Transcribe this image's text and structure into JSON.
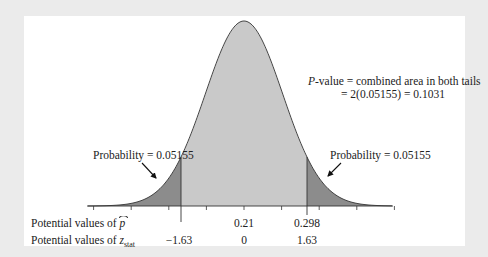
{
  "chart_data": {
    "type": "area",
    "title": "",
    "distribution": {
      "family": "normal",
      "center_phat": 0.21,
      "center_z": 0
    },
    "critical_values": {
      "left": {
        "z": -1.63,
        "phat": null
      },
      "right": {
        "z": 1.63,
        "phat": 0.298
      }
    },
    "tail_probability": 0.05155,
    "p_value": 0.1031,
    "axes": {
      "row1_label_prefix": "Potential values of ",
      "row1_symbol": "p",
      "row2_label_prefix": "Potential values of ",
      "row2_symbol": "z",
      "row2_subscript": "stat",
      "phat_ticks": [
        "0.21",
        "0.298"
      ],
      "z_ticks": [
        "−1.63",
        "0",
        "1.63"
      ]
    },
    "annotations": {
      "pvalue_line1_italic": "P",
      "pvalue_line1_rest": "-value = combined area in both tails",
      "pvalue_line2": "= 2(0.05155) = 0.1031",
      "left_tail_label": "Probability = 0.05155",
      "right_tail_label": "Probability = 0.05155"
    },
    "colors": {
      "background": "#ebebeb",
      "panel": "#ffffff",
      "body_fill": "#c9c9c9",
      "tail_fill": "#8c8c8c",
      "stroke": "#333333"
    },
    "legend": null,
    "grid": false
  }
}
